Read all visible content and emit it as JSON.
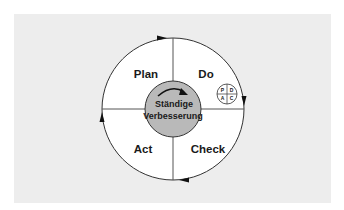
{
  "diagram": {
    "quadrants": [
      {
        "id": "plan",
        "label": "Plan"
      },
      {
        "id": "do",
        "label": "Do"
      },
      {
        "id": "check",
        "label": "Check"
      },
      {
        "id": "act",
        "label": "Act"
      }
    ],
    "center": {
      "line1": "Ständige",
      "line2": "Verbesserung"
    },
    "mini_cycle": {
      "top_left": "P",
      "top_right": "D",
      "bottom_left": "A",
      "bottom_right": "C"
    },
    "colors": {
      "panel_background": "#ededed",
      "circle_fill": "#ffffff",
      "center_fill": "#b9b9b9",
      "stroke": "#333333"
    }
  }
}
